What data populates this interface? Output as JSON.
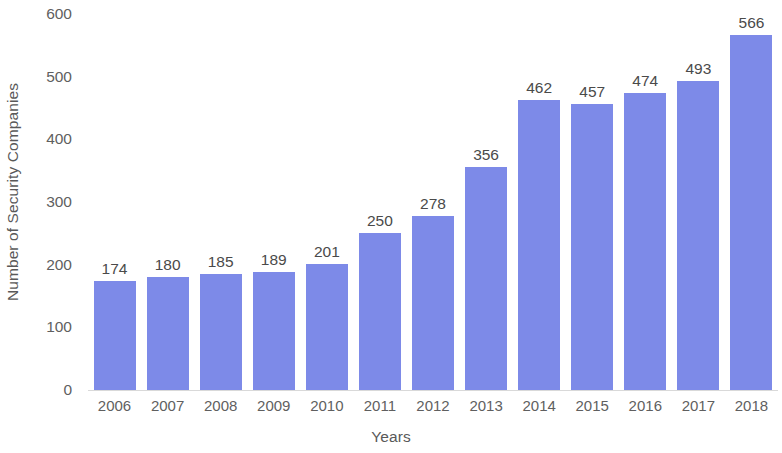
{
  "chart_data": {
    "type": "bar",
    "title": "",
    "xlabel": "Years",
    "ylabel": "Number of Security Companies",
    "categories": [
      "2006",
      "2007",
      "2008",
      "2009",
      "2010",
      "2011",
      "2012",
      "2013",
      "2014",
      "2015",
      "2016",
      "2017",
      "2018"
    ],
    "values": [
      174,
      180,
      185,
      189,
      201,
      250,
      278,
      356,
      462,
      457,
      474,
      493,
      566
    ],
    "data_labels": [
      "174",
      "180",
      "185",
      "189",
      "201",
      "250",
      "278",
      "356",
      "462",
      "457",
      "474",
      "493",
      "566"
    ],
    "ylim": [
      0,
      600
    ],
    "y_ticks": [
      0,
      100,
      200,
      300,
      400,
      500,
      600
    ],
    "y_tick_labels": [
      "0",
      "100",
      "200",
      "300",
      "400",
      "500",
      "600"
    ],
    "grid": false,
    "legend": null,
    "legend_position": "none",
    "series": [
      {
        "name": "Number of Security Companies",
        "values": [
          174,
          180,
          185,
          189,
          201,
          250,
          278,
          356,
          462,
          457,
          474,
          493,
          566
        ],
        "color": "#7d8ae8"
      }
    ],
    "colors": {
      "bar": "#7d8ae8",
      "axis_line": "#d9d9d9",
      "tick_text": "#5f5f5f",
      "title_text": "#595959",
      "value_text": "#4a4a4a",
      "background": "#ffffff"
    }
  }
}
